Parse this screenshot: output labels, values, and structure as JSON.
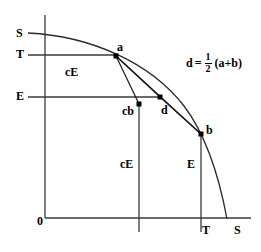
{
  "figure": {
    "type": "economics-diagram",
    "axes": {
      "origin_label": "0",
      "y_axis_labels": [
        {
          "text": "S",
          "x": 16,
          "y": 27
        },
        {
          "text": "T",
          "x": 16,
          "y": 48
        },
        {
          "text": "E",
          "x": 16,
          "y": 90
        }
      ],
      "x_axis_labels": [
        {
          "text": "T",
          "x": 202,
          "y": 224
        },
        {
          "text": "S",
          "x": 234,
          "y": 224
        }
      ]
    },
    "points": [
      {
        "name": "a",
        "label": "a",
        "x": 116,
        "y": 56,
        "label_x": 117,
        "label_y": 41
      },
      {
        "name": "b",
        "label": "b",
        "x": 201,
        "y": 134,
        "label_x": 206,
        "label_y": 124
      },
      {
        "name": "d",
        "label": "d",
        "x": 160,
        "y": 97,
        "label_x": 161,
        "label_y": 104
      },
      {
        "name": "cb",
        "label": "cb",
        "x": 139,
        "y": 104,
        "label_x": 122,
        "label_y": 105
      }
    ],
    "region_labels": [
      {
        "text": "cE",
        "x": 65,
        "y": 66
      },
      {
        "text": "cE",
        "x": 120,
        "y": 158
      },
      {
        "text": "E",
        "x": 187,
        "y": 158
      }
    ],
    "formula": {
      "lhs": "d",
      "equals": "=",
      "numerator": "1",
      "denominator": "2",
      "rhs": "(a+b)",
      "x": 186,
      "y": 52
    },
    "colors": {
      "stroke": "#1a1a1a",
      "background": "#ffffff",
      "text": "#000000"
    }
  }
}
